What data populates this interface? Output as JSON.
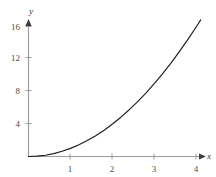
{
  "chart_data": {
    "type": "line",
    "title": "",
    "subtitle": "",
    "xlabel": "x",
    "ylabel": "y",
    "function": "y = x^2",
    "xlim": [
      0,
      4.25
    ],
    "ylim": [
      0,
      17.6
    ],
    "grid": false,
    "legend": null,
    "x_ticks": [
      1,
      2,
      3,
      4
    ],
    "x_tick_labels": [
      "1",
      "2",
      "3",
      "4"
    ],
    "y_ticks": [
      4,
      8,
      12,
      16
    ],
    "y_tick_labels": [
      "4",
      "8",
      "12",
      "16"
    ],
    "series": [
      {
        "name": "y = x^2",
        "x": [
          0,
          0.2,
          0.4,
          0.6,
          0.8,
          1,
          1.2,
          1.4,
          1.6,
          1.8,
          2,
          2.2,
          2.4,
          2.6,
          2.8,
          3,
          3.2,
          3.4,
          3.6,
          3.8,
          4,
          4.1
        ],
        "values": [
          0,
          0.04,
          0.16,
          0.36,
          0.64,
          1,
          1.44,
          1.96,
          2.56,
          3.24,
          4,
          4.84,
          5.76,
          6.76,
          7.84,
          9,
          10.24,
          11.56,
          12.96,
          14.44,
          16,
          16.81
        ],
        "color": "#1c1c1c"
      }
    ],
    "annotations": [],
    "colors": {
      "axis": "#9a9a9a",
      "curve": "#1c1c1c",
      "tick_label": "#4a4a4a",
      "axis_label": "#3a3a3a",
      "background": "#ffffff"
    }
  }
}
